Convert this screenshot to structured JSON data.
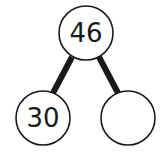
{
  "diagram": {
    "type": "number-bond",
    "whole": {
      "value": "46"
    },
    "parts": [
      {
        "value": "30"
      },
      {
        "value": ""
      }
    ],
    "colors": {
      "stroke": "#1a1a1a",
      "fill": "#ffffff"
    }
  }
}
